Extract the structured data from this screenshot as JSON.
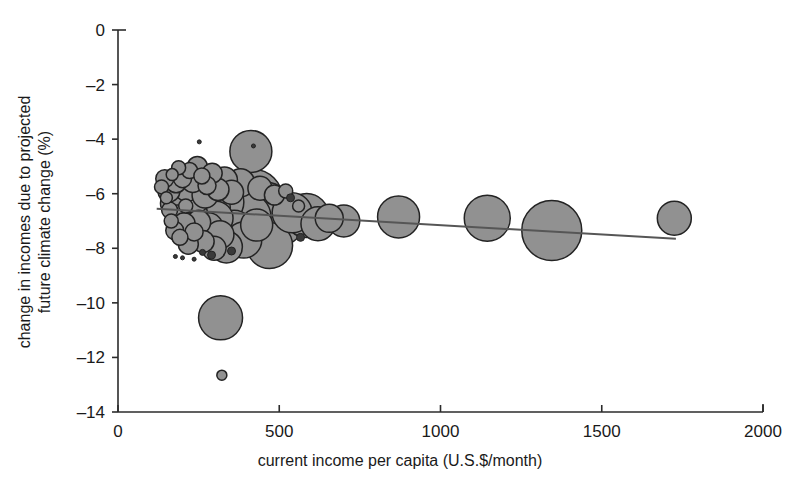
{
  "chart_data": {
    "type": "scatter",
    "title": "",
    "xlabel": "current income per capita (U.S.$/month)",
    "ylabel_line1": "change in incomes due to projected",
    "ylabel_line2": "future climate change (%)",
    "xlim": [
      0,
      2000
    ],
    "ylim": [
      -14,
      0
    ],
    "xticks": [
      0,
      500,
      1000,
      1500,
      2000
    ],
    "xtick_labels": [
      "0",
      "500",
      "1000",
      "1500",
      "2000"
    ],
    "yticks": [
      0,
      -2,
      -4,
      -6,
      -8,
      -10,
      -12,
      -14
    ],
    "ytick_labels": [
      "0",
      "–2",
      "–4",
      "–6",
      "–8",
      "–10",
      "–12",
      "–14"
    ],
    "grid": false,
    "legend": "none",
    "bubble_fill": "#919191",
    "bubble_stroke": "#232323",
    "trendline_color": "#565656",
    "trendline": {
      "x_start": 120,
      "y_start": -6.55,
      "x_end": 1730,
      "y_end": -7.65
    },
    "series": [
      {
        "name": "countries",
        "size_meaning": "population",
        "points": [
          {
            "x": 135,
            "y": -5.75,
            "r": 7
          },
          {
            "x": 145,
            "y": -5.45,
            "r": 9
          },
          {
            "x": 150,
            "y": -6.15,
            "r": 6
          },
          {
            "x": 158,
            "y": -5.9,
            "r": 11
          },
          {
            "x": 160,
            "y": -6.6,
            "r": 8
          },
          {
            "x": 165,
            "y": -7.0,
            "r": 7
          },
          {
            "x": 168,
            "y": -5.3,
            "r": 6
          },
          {
            "x": 172,
            "y": -6.35,
            "r": 13
          },
          {
            "x": 176,
            "y": -7.35,
            "r": 9
          },
          {
            "x": 180,
            "y": -5.6,
            "r": 10
          },
          {
            "x": 185,
            "y": -6.85,
            "r": 12
          },
          {
            "x": 188,
            "y": -5.05,
            "r": 7
          },
          {
            "x": 192,
            "y": -7.6,
            "r": 8
          },
          {
            "x": 196,
            "y": -6.1,
            "r": 15
          },
          {
            "x": 200,
            "y": -5.45,
            "r": 9
          },
          {
            "x": 205,
            "y": -7.1,
            "r": 11
          },
          {
            "x": 210,
            "y": -6.45,
            "r": 7
          },
          {
            "x": 214,
            "y": -5.8,
            "r": 13
          },
          {
            "x": 218,
            "y": -7.85,
            "r": 10
          },
          {
            "x": 222,
            "y": -5.15,
            "r": 8
          },
          {
            "x": 228,
            "y": -6.75,
            "r": 16
          },
          {
            "x": 232,
            "y": -5.55,
            "r": 11
          },
          {
            "x": 236,
            "y": -7.4,
            "r": 9
          },
          {
            "x": 240,
            "y": -6.2,
            "r": 14
          },
          {
            "x": 246,
            "y": -5.0,
            "r": 10
          },
          {
            "x": 250,
            "y": -7.05,
            "r": 12
          },
          {
            "x": 256,
            "y": -6.6,
            "r": 18
          },
          {
            "x": 260,
            "y": -5.35,
            "r": 8
          },
          {
            "x": 264,
            "y": -7.75,
            "r": 11
          },
          {
            "x": 270,
            "y": -6.05,
            "r": 13
          },
          {
            "x": 276,
            "y": -5.7,
            "r": 9
          },
          {
            "x": 280,
            "y": -7.25,
            "r": 15
          },
          {
            "x": 286,
            "y": -6.5,
            "r": 20
          },
          {
            "x": 292,
            "y": -5.25,
            "r": 10
          },
          {
            "x": 298,
            "y": -8.0,
            "r": 12
          },
          {
            "x": 304,
            "y": -6.9,
            "r": 17
          },
          {
            "x": 310,
            "y": -5.85,
            "r": 11
          },
          {
            "x": 316,
            "y": -7.5,
            "r": 14
          },
          {
            "x": 322,
            "y": -6.3,
            "r": 22
          },
          {
            "x": 330,
            "y": -5.5,
            "r": 13
          },
          {
            "x": 336,
            "y": -7.95,
            "r": 16
          },
          {
            "x": 344,
            "y": -6.7,
            "r": 25
          },
          {
            "x": 352,
            "y": -5.95,
            "r": 12
          },
          {
            "x": 360,
            "y": -7.3,
            "r": 19
          },
          {
            "x": 370,
            "y": -6.4,
            "r": 27
          },
          {
            "x": 380,
            "y": -5.6,
            "r": 14
          },
          {
            "x": 390,
            "y": -7.7,
            "r": 18
          },
          {
            "x": 400,
            "y": -6.85,
            "r": 24
          },
          {
            "x": 412,
            "y": -4.45,
            "r": 21
          },
          {
            "x": 418,
            "y": -6.2,
            "r": 30
          },
          {
            "x": 430,
            "y": -7.15,
            "r": 16
          },
          {
            "x": 440,
            "y": -5.8,
            "r": 12
          },
          {
            "x": 455,
            "y": -6.6,
            "r": 28
          },
          {
            "x": 470,
            "y": -7.9,
            "r": 23
          },
          {
            "x": 485,
            "y": -6.05,
            "r": 10
          },
          {
            "x": 500,
            "y": -6.95,
            "r": 26
          },
          {
            "x": 520,
            "y": -5.9,
            "r": 7
          },
          {
            "x": 540,
            "y": -6.7,
            "r": 20
          },
          {
            "x": 560,
            "y": -6.45,
            "r": 6
          },
          {
            "x": 585,
            "y": -6.8,
            "r": 22
          },
          {
            "x": 620,
            "y": -7.1,
            "r": 17
          },
          {
            "x": 655,
            "y": -6.9,
            "r": 14
          },
          {
            "x": 700,
            "y": -7.0,
            "r": 16
          },
          {
            "x": 870,
            "y": -6.85,
            "r": 21
          },
          {
            "x": 1145,
            "y": -6.9,
            "r": 23
          },
          {
            "x": 1345,
            "y": -7.35,
            "r": 30
          },
          {
            "x": 1725,
            "y": -6.9,
            "r": 17
          },
          {
            "x": 318,
            "y": -10.55,
            "r": 22
          },
          {
            "x": 322,
            "y": -12.65,
            "r": 5
          },
          {
            "x": 200,
            "y": -8.35,
            "r": 2
          },
          {
            "x": 262,
            "y": -8.15,
            "r": 3
          },
          {
            "x": 290,
            "y": -8.25,
            "r": 4
          },
          {
            "x": 352,
            "y": -8.1,
            "r": 4
          },
          {
            "x": 236,
            "y": -8.4,
            "r": 2
          },
          {
            "x": 178,
            "y": -8.3,
            "r": 2
          },
          {
            "x": 420,
            "y": -4.25,
            "r": 2
          },
          {
            "x": 252,
            "y": -4.1,
            "r": 2
          },
          {
            "x": 535,
            "y": -6.15,
            "r": 4
          },
          {
            "x": 566,
            "y": -7.6,
            "r": 4
          }
        ]
      }
    ]
  }
}
